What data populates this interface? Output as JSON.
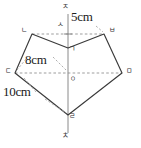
{
  "figure": {
    "type": "geometry-diagram",
    "background_color": "#ffffff",
    "solid_edge_color": "#3a3a3a",
    "dashed_edge_color": "#8d8d8d",
    "axis_color": "#7d7d7d",
    "text_color": "#202020"
  },
  "vertices": [
    {
      "id": "n",
      "label": "ㄴ",
      "x": 32,
      "y": 34,
      "label_x": 21,
      "label_y": 29,
      "kind": "polygon-vertex"
    },
    {
      "id": "b",
      "label": "ㅂ",
      "x": 104,
      "y": 34,
      "label_x": 110,
      "label_y": 29,
      "kind": "polygon-vertex"
    },
    {
      "id": "g",
      "label": "ㄱ",
      "x": 68,
      "y": 48,
      "label_x": 70,
      "label_y": 47,
      "kind": "polygon-vertex"
    },
    {
      "id": "m",
      "label": "ㅁ",
      "x": 122,
      "y": 73,
      "label_x": 126,
      "label_y": 69,
      "kind": "polygon-vertex"
    },
    {
      "id": "d",
      "label": "ㄷ",
      "x": 15,
      "y": 73,
      "label_x": 6,
      "label_y": 69,
      "kind": "polygon-vertex"
    },
    {
      "id": "r",
      "label": "ㄹ",
      "x": 68,
      "y": 115,
      "label_x": 70,
      "label_y": 114,
      "kind": "polygon-vertex"
    },
    {
      "id": "o",
      "label": "ㅇ",
      "x": 68,
      "y": 73,
      "label_x": 70,
      "label_y": 76,
      "kind": "center-point"
    },
    {
      "id": "s",
      "label": "ㅅ",
      "x": 68,
      "y": 34,
      "label_x": 58,
      "label_y": 22,
      "kind": "axis-point"
    },
    {
      "id": "j",
      "label": "ㅈ",
      "x": 68,
      "y": 10,
      "label_x": 63,
      "label_y": 6,
      "kind": "axis-endpoint-top"
    },
    {
      "id": "ch",
      "label": "ㅊ",
      "x": 68,
      "y": 138,
      "label_x": 63,
      "label_y": 133,
      "kind": "axis-endpoint-bottom"
    }
  ],
  "measurements": [
    {
      "id": "top",
      "text": "5cm",
      "label_x": 72,
      "label_y": 12,
      "describes": "ㅅ to ㅈ segment"
    },
    {
      "id": "radius",
      "text": "8cm",
      "label_x": 26,
      "label_y": 56,
      "describes": "ㄷ to ㅇ segment"
    },
    {
      "id": "side",
      "text": "10cm",
      "label_x": 4,
      "label_y": 88,
      "describes": "ㄷ to ㄹ segment"
    }
  ],
  "solid_edges": [
    {
      "from": "n",
      "to": "g"
    },
    {
      "from": "g",
      "to": "b"
    },
    {
      "from": "b",
      "to": "m"
    },
    {
      "from": "m",
      "to": "r"
    },
    {
      "from": "r",
      "to": "d"
    },
    {
      "from": "d",
      "to": "n"
    }
  ],
  "dashed_edges": [
    {
      "from": "n",
      "to": "b",
      "note": "horizontal chord through ㅅ"
    },
    {
      "from": "d",
      "to": "m",
      "note": "horizontal chord through ㅇ"
    }
  ],
  "axis": {
    "from": "j",
    "to": "ch",
    "note": "vertical axis of symmetry through ㅅ, ㄱ, ㅇ, ㄹ"
  },
  "leaders": [
    {
      "id": "leader-8cm",
      "from_x": 52,
      "from_y": 57,
      "to_x": 66,
      "to_y": 71
    },
    {
      "id": "leader-8cm-left",
      "from_x": 25,
      "from_y": 59,
      "to_x": 17,
      "to_y": 71
    },
    {
      "id": "leader-10cm",
      "from_x": 25,
      "from_y": 78,
      "to_x": 40,
      "to_y": 96
    },
    {
      "id": "leader-10cm-b",
      "from_x": 43,
      "from_y": 99,
      "to_x": 65,
      "to_y": 113
    },
    {
      "id": "leader-5cm",
      "from_x": 96,
      "from_y": 26,
      "to_x": 103,
      "to_y": 32
    }
  ]
}
